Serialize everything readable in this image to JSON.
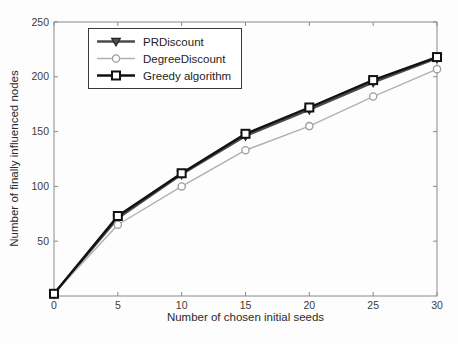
{
  "figure": {
    "background": "#fdfdfd",
    "axis_color": "#8a8a8a",
    "tick_label_color": "#3c3c3c"
  },
  "chart_data": {
    "type": "line",
    "title": "",
    "xlabel": "Number of chosen initial seeds",
    "ylabel": "Number of finally influenced nodes",
    "x": [
      0,
      5,
      10,
      15,
      20,
      25,
      30
    ],
    "xlim": [
      0,
      30
    ],
    "ylim": [
      0,
      250
    ],
    "xticks": [
      0,
      5,
      10,
      15,
      20,
      25,
      30
    ],
    "yticks": [
      50,
      100,
      150,
      200,
      250
    ],
    "grid": false,
    "legend_position": "top-left",
    "series": [
      {
        "name": "PRDiscount",
        "marker": "triangle-down",
        "line_color": "#4a4a4a",
        "marker_edge": "#262626",
        "marker_fill": "#4f4f4f",
        "line_width": 2.4,
        "values": [
          2,
          71,
          111,
          146,
          170,
          195,
          217
        ]
      },
      {
        "name": "DegreeDiscount",
        "marker": "circle",
        "line_color": "#b0b0b0",
        "marker_edge": "#9e9e9e",
        "marker_fill": "#ffffff",
        "line_width": 1.4,
        "values": [
          2,
          65,
          100,
          133,
          155,
          182,
          207
        ]
      },
      {
        "name": "Greedy algorithm",
        "marker": "square",
        "line_color": "#111111",
        "marker_edge": "#111111",
        "marker_fill": "#ffffff",
        "line_width": 2.4,
        "values": [
          2,
          73,
          112,
          148,
          172,
          197,
          218
        ]
      }
    ]
  }
}
